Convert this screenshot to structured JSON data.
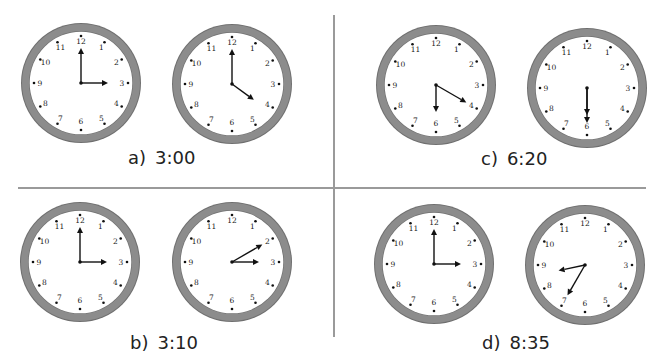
{
  "colors": {
    "ring": "#8c8c8c",
    "ring_edge": "#6f6f6f",
    "face": "#ffffff",
    "hand": "#111111",
    "divider": "#9a9a9a",
    "text": "#222222"
  },
  "clock_numbers": [
    "12",
    "1",
    "2",
    "3",
    "4",
    "5",
    "6",
    "7",
    "8",
    "9",
    "10",
    "11"
  ],
  "panels": [
    {
      "id": "a",
      "label_letter": "a)",
      "label_time": "3:00",
      "clocks": [
        {
          "hands": [
            {
              "type": "minute",
              "target": 12
            },
            {
              "type": "hour",
              "target": 3
            }
          ]
        },
        {
          "hands": [
            {
              "type": "minute",
              "target": 12
            },
            {
              "type": "hour",
              "target": 4.2
            }
          ]
        }
      ]
    },
    {
      "id": "b",
      "label_letter": "b)",
      "label_time": "3:10",
      "clocks": [
        {
          "hands": [
            {
              "type": "minute",
              "target": 12
            },
            {
              "type": "hour",
              "target": 3
            }
          ]
        },
        {
          "hands": [
            {
              "type": "minute",
              "target": 2
            },
            {
              "type": "hour",
              "target": 3
            }
          ]
        }
      ]
    },
    {
      "id": "c",
      "label_letter": "c)",
      "label_time": "6:20",
      "clocks": [
        {
          "hands": [
            {
              "type": "minute",
              "target": 4
            },
            {
              "type": "hour",
              "target": 6
            }
          ]
        },
        {
          "hands": [
            {
              "type": "minute",
              "target": 6
            },
            {
              "type": "hour",
              "target": 6
            }
          ]
        }
      ]
    },
    {
      "id": "d",
      "label_letter": "d)",
      "label_time": "8:35",
      "clocks": [
        {
          "hands": [
            {
              "type": "minute",
              "target": 12
            },
            {
              "type": "hour",
              "target": 3
            }
          ]
        },
        {
          "hands": [
            {
              "type": "minute",
              "target": 7
            },
            {
              "type": "hour",
              "target": 8.6
            }
          ]
        }
      ]
    }
  ]
}
